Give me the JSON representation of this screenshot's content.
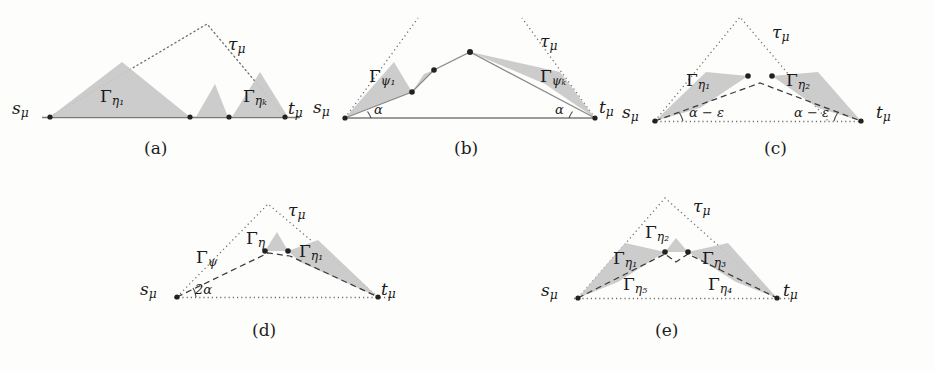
{
  "figure": {
    "background_color": "#fdfdfb",
    "shade_color": "#c9c9c9",
    "line_color": "#3a3a3a",
    "panels": [
      {
        "id": "a",
        "caption": "(a)",
        "labels": {
          "source": "s",
          "source_sub": "μ",
          "target": "t",
          "target_sub": "μ",
          "tau": "τ",
          "tau_sub": "μ",
          "gamma_first": "Γ",
          "gamma_first_sub": "η₁",
          "gamma_last": "Γ",
          "gamma_last_sub": "ηₖ"
        }
      },
      {
        "id": "b",
        "caption": "(b)",
        "labels": {
          "source": "s",
          "source_sub": "μ",
          "target": "t",
          "target_sub": "μ",
          "tau": "τ",
          "tau_sub": "μ",
          "gamma_first": "Γ",
          "gamma_first_sub": "ψ₁",
          "gamma_last": "Γ",
          "gamma_last_sub": "ψₖ",
          "angle_left": "α",
          "angle_right": "α"
        }
      },
      {
        "id": "c",
        "caption": "(c)",
        "labels": {
          "source": "s",
          "source_sub": "μ",
          "target": "t",
          "target_sub": "μ",
          "tau": "τ",
          "tau_sub": "μ",
          "gamma_1": "Γ",
          "gamma_1_sub": "η₁",
          "gamma_2": "Γ",
          "gamma_2_sub": "η₂",
          "angle_left": "α − ε",
          "angle_right": "α − ε"
        }
      },
      {
        "id": "d",
        "caption": "(d)",
        "labels": {
          "source": "s",
          "source_sub": "μ",
          "target": "t",
          "target_sub": "μ",
          "tau": "τ",
          "tau_sub": "μ",
          "gamma_eta": "Γ",
          "gamma_eta_sub": "η",
          "gamma_psi": "Γ",
          "gamma_psi_sub": "ψ",
          "gamma_eta1": "Γ",
          "gamma_eta1_sub": "η₁",
          "angle_left": "2α"
        }
      },
      {
        "id": "e",
        "caption": "(e)",
        "labels": {
          "source": "s",
          "source_sub": "μ",
          "target": "t",
          "target_sub": "μ",
          "tau": "τ",
          "tau_sub": "μ",
          "gamma_1": "Γ",
          "gamma_1_sub": "η₁",
          "gamma_2": "Γ",
          "gamma_2_sub": "η₂",
          "gamma_3": "Γ",
          "gamma_3_sub": "η₃",
          "gamma_4": "Γ",
          "gamma_4_sub": "η₄",
          "gamma_5": "Γ",
          "gamma_5_sub": "η₅"
        }
      }
    ]
  }
}
